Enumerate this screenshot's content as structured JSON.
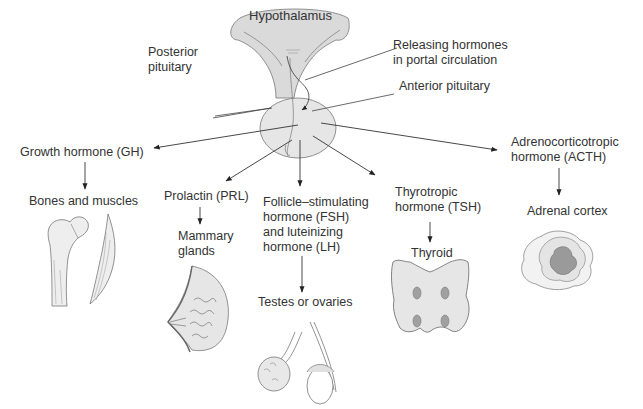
{
  "diagram": {
    "source_structure": {
      "hypothalamus": "Hypothalamus",
      "posterior_pituitary": [
        "Posterior",
        "pituitary"
      ],
      "releasing_hormones": [
        "Releasing hormones",
        "in portal circulation"
      ],
      "anterior_pituitary": "Anterior pituitary"
    },
    "hormones": [
      {
        "id": "gh",
        "label": [
          "Growth hormone (GH)"
        ],
        "target": [
          "Bones and muscles"
        ]
      },
      {
        "id": "prl",
        "label": [
          "Prolactin (PRL)"
        ],
        "target": [
          "Mammary",
          "glands"
        ]
      },
      {
        "id": "fsh_lh",
        "label": [
          "Follicle–stimulating",
          "hormone (FSH)",
          "and luteinizing",
          "hormone (LH)"
        ],
        "target": [
          "Testes or ovaries"
        ]
      },
      {
        "id": "tsh",
        "label": [
          "Thyrotropic",
          "hormone (TSH)"
        ],
        "target": [
          "Thyroid"
        ]
      },
      {
        "id": "acth",
        "label": [
          "Adrenocorticotropic",
          "hormone (ACTH)"
        ],
        "target": [
          "Adrenal cortex"
        ]
      }
    ],
    "colors": {
      "line": "#333333",
      "organ_fill": "#e6e6e6",
      "hypothalamus_fill": "#d9d9d9",
      "dark_fill": "#9a9a9a",
      "text": "#333333"
    }
  }
}
